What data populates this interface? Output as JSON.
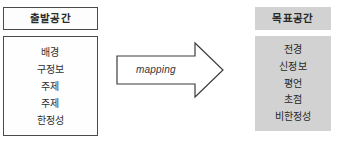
{
  "source_space": {
    "title": "출발공간",
    "items": [
      "배경",
      "구정보",
      "주제",
      "주제",
      "한정성"
    ]
  },
  "target_space": {
    "title": "목표공간",
    "items": [
      "전경",
      "신정보",
      "평언",
      "초점",
      "비한정성"
    ]
  },
  "mapping_arrow": {
    "label": "mapping",
    "direction": "right"
  },
  "colors": {
    "page_background": "#ffffff",
    "source_box_background": "#fefefe",
    "source_box_border": "#4a4a4a",
    "target_box_background": "#d2d2d2",
    "arrow_outline": "#3d3d3d",
    "arrow_fill": "#ffffff",
    "text": "#2a2a2a"
  }
}
